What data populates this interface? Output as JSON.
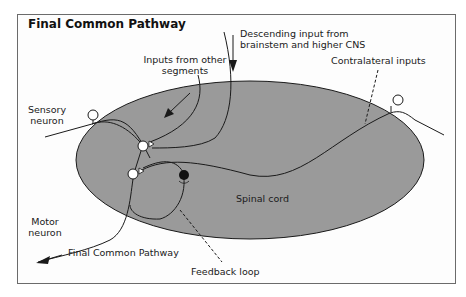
{
  "title": "Final Common Pathway",
  "labels": {
    "descending_line1": "Descending input from",
    "descending_line2": "brainstem and higher CNS",
    "inputs_other_line1": "Inputs from other",
    "inputs_other_line2": "segments",
    "contralateral": "Contralateral inputs",
    "sensory_line1": "Sensory",
    "sensory_line2": "neuron",
    "spinal_cord": "Spinal cord",
    "motor_line1": "Motor",
    "motor_line2": "neuron",
    "final_common_pathway": "Final Common Pathway",
    "feedback_loop": "Feedback loop"
  },
  "colors": {
    "spinal_cord_fill": "#9a9a9a",
    "stroke": "#1a1a1a",
    "inhibitory_neuron": "#111111",
    "excitatory_neuron": "#ffffff"
  }
}
